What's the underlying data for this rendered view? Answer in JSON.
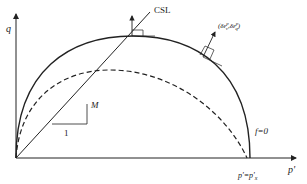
{
  "axes": {
    "y_label": "q",
    "x_label": "p'"
  },
  "labels": {
    "csl": "CSL",
    "slope": "M",
    "run": "1",
    "yield_surface": "f=0",
    "intercept": "p'=p'x",
    "plastic_strain_increment": "(δε_v^p, δε_q^p)"
  },
  "curves": {
    "yield_surface": "solid ellipse",
    "inner_surface": "dashed ellipse",
    "critical_state_line": "straight line through origin"
  },
  "colors": {
    "line": "#222222",
    "background": "#ffffff"
  }
}
